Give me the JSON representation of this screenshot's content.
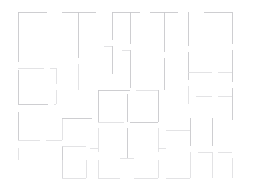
{
  "document": {
    "kind": "architectural-floor-plan",
    "title": "Floor Plan",
    "width": 256,
    "height": 192,
    "background_color": "#ffffff",
    "wall_color": "#c9c9cc",
    "wall_color_faint": "#dcdcdf",
    "wall_color_strong": "#babac0",
    "stroke_width": 0.9,
    "labels": [],
    "dimensions_shown": "none",
    "extents": {
      "left": 18,
      "top": 12,
      "right": 232,
      "bottom": 178
    }
  },
  "geometry": {
    "note": "Wall segments as [x1,y1,x2,y2] in screenshot pixel coordinates. Gaps between collinear segments represent door/passage openings.",
    "segments": [
      [
        18,
        12,
        47,
        12
      ],
      [
        18,
        12,
        18,
        62
      ],
      [
        18,
        70,
        18,
        104
      ],
      [
        18,
        112,
        18,
        140
      ],
      [
        18,
        148,
        18,
        160
      ],
      [
        62,
        12,
        96,
        12
      ],
      [
        78,
        12,
        78,
        58
      ],
      [
        78,
        64,
        78,
        90
      ],
      [
        18,
        68,
        44,
        68
      ],
      [
        50,
        68,
        56,
        68
      ],
      [
        56,
        68,
        56,
        84
      ],
      [
        56,
        90,
        56,
        104
      ],
      [
        18,
        104,
        48,
        104
      ],
      [
        54,
        104,
        56,
        104
      ],
      [
        18,
        140,
        40,
        140
      ],
      [
        46,
        140,
        62,
        140
      ],
      [
        62,
        118,
        62,
        140
      ],
      [
        62,
        146,
        62,
        178
      ],
      [
        62,
        178,
        86,
        178
      ],
      [
        62,
        118,
        92,
        118
      ],
      [
        112,
        12,
        140,
        12
      ],
      [
        112,
        12,
        112,
        40
      ],
      [
        112,
        46,
        112,
        74
      ],
      [
        104,
        46,
        112,
        46
      ],
      [
        130,
        12,
        130,
        44
      ],
      [
        130,
        50,
        130,
        88
      ],
      [
        122,
        50,
        130,
        50
      ],
      [
        150,
        12,
        178,
        12
      ],
      [
        164,
        12,
        164,
        52
      ],
      [
        164,
        58,
        164,
        90
      ],
      [
        204,
        12,
        232,
        12
      ],
      [
        232,
        12,
        232,
        44
      ],
      [
        232,
        50,
        232,
        82
      ],
      [
        232,
        88,
        232,
        120
      ],
      [
        188,
        12,
        188,
        46
      ],
      [
        188,
        52,
        188,
        80
      ],
      [
        188,
        86,
        188,
        104
      ],
      [
        188,
        72,
        212,
        72
      ],
      [
        218,
        72,
        232,
        72
      ],
      [
        196,
        96,
        212,
        96
      ],
      [
        218,
        96,
        232,
        96
      ],
      [
        98,
        90,
        130,
        90
      ],
      [
        136,
        90,
        158,
        90
      ],
      [
        98,
        90,
        98,
        122
      ],
      [
        158,
        90,
        158,
        122
      ],
      [
        127,
        94,
        127,
        122
      ],
      [
        98,
        122,
        124,
        122
      ],
      [
        130,
        122,
        158,
        122
      ],
      [
        98,
        128,
        98,
        152
      ],
      [
        127,
        128,
        127,
        158
      ],
      [
        158,
        128,
        158,
        152
      ],
      [
        90,
        148,
        98,
        148
      ],
      [
        158,
        148,
        166,
        148
      ],
      [
        120,
        158,
        134,
        158
      ],
      [
        62,
        146,
        86,
        146
      ],
      [
        166,
        130,
        190,
        130
      ],
      [
        190,
        118,
        190,
        146
      ],
      [
        190,
        152,
        190,
        178
      ],
      [
        166,
        178,
        190,
        178
      ],
      [
        212,
        118,
        212,
        146
      ],
      [
        212,
        152,
        212,
        178
      ],
      [
        198,
        152,
        212,
        152
      ],
      [
        218,
        152,
        232,
        152
      ],
      [
        62,
        160,
        62,
        178
      ],
      [
        86,
        160,
        86,
        178
      ],
      [
        98,
        160,
        98,
        178
      ],
      [
        98,
        178,
        120,
        178
      ],
      [
        134,
        178,
        158,
        178
      ],
      [
        158,
        160,
        158,
        178
      ],
      [
        232,
        158,
        232,
        178
      ]
    ]
  }
}
